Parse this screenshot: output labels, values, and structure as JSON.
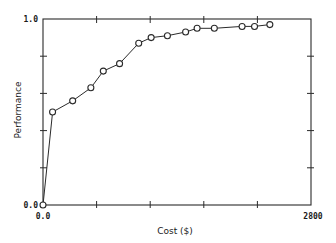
{
  "chart_data": {
    "type": "line",
    "title": "",
    "xlabel": "Cost ($)",
    "ylabel": "Performance",
    "xlim": [
      0,
      2800
    ],
    "ylim": [
      0.0,
      1.0
    ],
    "x_tick_labels": [
      "0.0",
      "2800"
    ],
    "y_tick_labels": [
      "0.0",
      "1.0"
    ],
    "x_ticks": [
      0,
      560,
      1120,
      1680,
      2240,
      2800
    ],
    "y_ticks": [
      0.0,
      0.2,
      0.4,
      0.6,
      0.8,
      1.0
    ],
    "grid": false,
    "legend": null,
    "marker": "open-circle",
    "series": [
      {
        "name": "Performance vs Cost",
        "x": [
          0,
          100,
          310,
          500,
          630,
          800,
          1000,
          1130,
          1300,
          1490,
          1610,
          1790,
          2080,
          2210,
          2370
        ],
        "y": [
          0.0,
          0.5,
          0.56,
          0.63,
          0.72,
          0.76,
          0.87,
          0.9,
          0.91,
          0.93,
          0.95,
          0.95,
          0.96,
          0.96,
          0.97
        ]
      }
    ]
  },
  "labels": {
    "xlabel": "Cost ($)",
    "ylabel": "Performance",
    "x_min": "0.0",
    "x_max": "2800",
    "y_min": "0.0",
    "y_max": "1.0"
  },
  "style": {
    "line_color": "#2a2a2a",
    "axis_color": "#2a2a2a",
    "background": "#ffffff"
  }
}
